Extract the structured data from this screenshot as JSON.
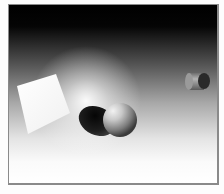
{
  "scene": {
    "description": "3D render: white square, sphere with shadow, small cylinder over black-to-white gradient",
    "colors": {
      "background_top": "#000000",
      "background_bottom": "#ffffff",
      "square": "#fafafa",
      "sphere_light": "#e8e8e8",
      "sphere_dark": "#3a3a3a",
      "shadow": "#151515",
      "cylinder_body": "#8c8c8c",
      "cylinder_cap": "#2a2a2a",
      "frame_border": "#8a8a8a"
    },
    "objects": [
      {
        "name": "square",
        "shape": "quad",
        "points": [
          [
            16,
            85
          ],
          [
            55,
            73
          ],
          [
            69,
            112
          ],
          [
            27,
            133
          ]
        ]
      },
      {
        "name": "sphere",
        "shape": "circle",
        "cx": 119,
        "cy": 119,
        "r": 17
      },
      {
        "name": "sphere-shadow",
        "shape": "ellipse",
        "cx": 96,
        "cy": 120,
        "rx": 19,
        "ry": 14
      },
      {
        "name": "cylinder",
        "shape": "cylinder",
        "x": 185,
        "y": 72,
        "w": 20,
        "h": 18
      }
    ]
  }
}
